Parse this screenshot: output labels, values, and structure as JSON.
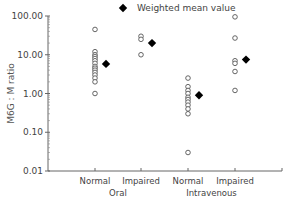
{
  "chart_data": {
    "type": "scatter",
    "title": "",
    "ylabel": "M6G : M ratio",
    "xlabel": "",
    "yscale": "log",
    "ylim": [
      0.01,
      100
    ],
    "yticks": [
      "100.00",
      "10.00",
      "1.00",
      "0.10",
      "0.01"
    ],
    "categories": [
      "Normal",
      "Impaired",
      "Normal",
      "Impaired"
    ],
    "groups": [
      "Oral",
      "Intravenous"
    ],
    "legend": {
      "label": "Weighted mean value",
      "marker": "filled-diamond",
      "position": "top"
    },
    "grid": false,
    "series": [
      {
        "name": "Individual values",
        "marker": "open-circle",
        "points": [
          {
            "category": "Oral Normal",
            "values": [
              45,
              12,
              10,
              9,
              8,
              7,
              6,
              5,
              4.5,
              4,
              3.5,
              3,
              2.5,
              2,
              1.0
            ]
          },
          {
            "category": "Oral Impaired",
            "values": [
              30,
              25,
              10
            ]
          },
          {
            "category": "Intravenous Normal",
            "values": [
              2.5,
              1.5,
              1.2,
              1.0,
              0.8,
              0.7,
              0.6,
              0.5,
              0.4,
              0.3,
              0.03
            ]
          },
          {
            "category": "Intravenous Impaired",
            "values": [
              95,
              27,
              7,
              6,
              3.7,
              1.2
            ]
          }
        ]
      },
      {
        "name": "Weighted mean value",
        "marker": "filled-diamond",
        "points": [
          {
            "category": "Oral Normal",
            "value": 5.8
          },
          {
            "category": "Oral Impaired",
            "value": 20
          },
          {
            "category": "Intravenous Normal",
            "value": 0.9
          },
          {
            "category": "Intravenous Impaired",
            "value": 7.5
          }
        ]
      }
    ]
  }
}
